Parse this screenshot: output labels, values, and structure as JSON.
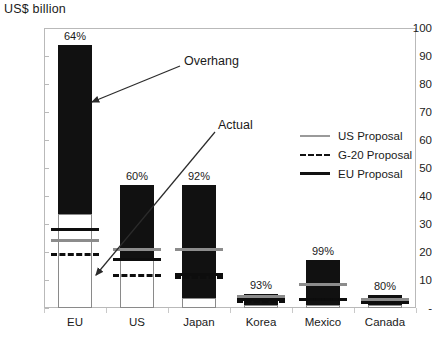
{
  "chart_data": {
    "type": "bar",
    "title": "",
    "ylabel": "US$ billion",
    "xlabel": "",
    "ylim": [
      0,
      100
    ],
    "ytick_labels": [
      "-",
      "10",
      "20",
      "30",
      "40",
      "50",
      "60",
      "70",
      "80",
      "90",
      "100"
    ],
    "ytick_values": [
      0,
      10,
      20,
      30,
      40,
      50,
      60,
      70,
      80,
      90,
      100
    ],
    "grid": false,
    "legend_position": "right",
    "categories": [
      "EU",
      "US",
      "Japan",
      "Korea",
      "Mexico",
      "Canada"
    ],
    "series": [
      {
        "name": "Actual",
        "values": [
          33.5,
          17.5,
          3.5,
          1.2,
          1.0,
          1.0
        ]
      },
      {
        "name": "Overhang",
        "values": [
          60.5,
          26.5,
          40.5,
          3.8,
          16.0,
          3.5
        ]
      },
      {
        "name": "Bound total",
        "values": [
          94.0,
          44.0,
          44.0,
          5.0,
          17.0,
          4.5
        ]
      }
    ],
    "data_labels": [
      "64%",
      "60%",
      "92%",
      "93%",
      "99%",
      "80%"
    ],
    "markers": [
      {
        "category": "EU",
        "us_proposal": 24.0,
        "g20_proposal": 19.0,
        "eu_proposal": 28.0
      },
      {
        "category": "US",
        "us_proposal": 21.0,
        "g20_proposal": 11.5,
        "eu_proposal": 17.5
      },
      {
        "category": "Japan",
        "us_proposal": 21.0,
        "g20_proposal": 11.0,
        "eu_proposal": 12.0
      },
      {
        "category": "Korea",
        "us_proposal": 4.2,
        "g20_proposal": 2.2,
        "eu_proposal": 3.2
      },
      {
        "category": "Mexico",
        "us_proposal": 8.5,
        "g20_proposal": 3.0,
        "eu_proposal": 3.0
      },
      {
        "category": "Canada",
        "us_proposal": 3.2,
        "g20_proposal": 2.0,
        "eu_proposal": 2.0
      }
    ],
    "annotations": [
      {
        "label": "Overhang",
        "target_category": "EU",
        "target_value": 73
      },
      {
        "label": "Actual",
        "target_category": "US",
        "target_value": 12
      }
    ],
    "legend": [
      {
        "label": "US Proposal",
        "style": "solid-gray",
        "color": "#9a9a9a"
      },
      {
        "label": "G-20 Proposal",
        "style": "dashed-black",
        "color": "#111111"
      },
      {
        "label": "EU Proposal",
        "style": "solid-black",
        "color": "#111111"
      }
    ],
    "colors": {
      "overhang": "#111111",
      "actual": "#ffffff",
      "actual_border": "#8a8a8a",
      "us_proposal": "#8c8c8c",
      "g20_proposal": "#0d0d0d",
      "eu_proposal": "#0d0d0d",
      "frame": "#b9b9b9"
    }
  }
}
